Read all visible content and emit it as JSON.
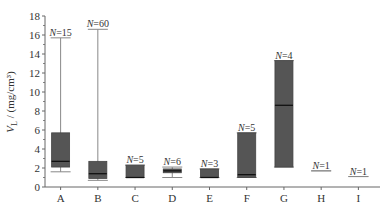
{
  "chart_data": {
    "type": "box",
    "title": "",
    "xlabel": "",
    "ylabel": "V_L / (mg/cm³)",
    "ylabel_parts": {
      "symbol": "V",
      "subscript": "L",
      "unit": " / (mg/cm³)"
    },
    "ylim": [
      0,
      18
    ],
    "yticks": [
      0,
      2,
      4,
      6,
      8,
      10,
      12,
      14,
      16,
      18
    ],
    "grid": false,
    "legend": null,
    "categories": [
      "A",
      "B",
      "C",
      "D",
      "E",
      "F",
      "G",
      "H",
      "I"
    ],
    "boxes": [
      {
        "label": "A",
        "n_label": "N=15",
        "n": 15,
        "whisker_low": 1.6,
        "q1": 2.1,
        "median": 2.7,
        "q3": 5.7,
        "whisker_high": 15.7
      },
      {
        "label": "B",
        "n_label": "N=60",
        "n": 60,
        "whisker_low": 0.7,
        "q1": 0.9,
        "median": 1.4,
        "q3": 2.7,
        "whisker_high": 16.6
      },
      {
        "label": "C",
        "n_label": "N=5",
        "n": 5,
        "whisker_low": 1.0,
        "q1": 1.0,
        "median": 1.0,
        "q3": 2.3,
        "whisker_high": 2.3
      },
      {
        "label": "D",
        "n_label": "N=6",
        "n": 6,
        "whisker_low": 1.0,
        "q1": 1.5,
        "median": 1.7,
        "q3": 1.9,
        "whisker_high": 2.1
      },
      {
        "label": "E",
        "n_label": "N=3",
        "n": 3,
        "whisker_low": 1.0,
        "q1": 1.0,
        "median": 1.0,
        "q3": 1.9,
        "whisker_high": 1.9
      },
      {
        "label": "F",
        "n_label": "N=5",
        "n": 5,
        "whisker_low": 1.0,
        "q1": 1.0,
        "median": 1.3,
        "q3": 5.7,
        "whisker_high": 5.7
      },
      {
        "label": "G",
        "n_label": "N=4",
        "n": 4,
        "whisker_low": 2.1,
        "q1": 2.1,
        "median": 8.6,
        "q3": 13.3,
        "whisker_high": 13.3
      },
      {
        "label": "H",
        "n_label": "N=1",
        "n": 1,
        "whisker_low": 1.7,
        "q1": 1.7,
        "median": 1.7,
        "q3": 1.7,
        "whisker_high": 1.7
      },
      {
        "label": "I",
        "n_label": "N=1",
        "n": 1,
        "whisker_low": 1.1,
        "q1": 1.1,
        "median": 1.1,
        "q3": 1.1,
        "whisker_high": 1.1
      }
    ]
  },
  "style": {
    "box_fill": "#555555",
    "box_stroke": "#444444",
    "median_color": "#111111",
    "whisker_color": "#888888",
    "axis_color": "#666666",
    "text_color": "#333333"
  }
}
